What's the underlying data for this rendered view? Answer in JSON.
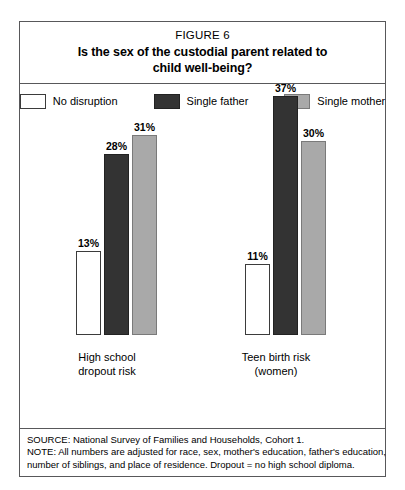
{
  "figure": {
    "number_label": "FIGURE 6",
    "title": "Is the sex of the custodial parent related to child well-being?",
    "title_line_1": "Is the sex of the custodial parent related to",
    "title_line_2": "child well-being?"
  },
  "legend": {
    "items": [
      {
        "label": "No disruption",
        "color": "#ffffff",
        "border": "#3b3b3b"
      },
      {
        "label": "Single father",
        "color": "#333333",
        "border": "#222222"
      },
      {
        "label": "Single mother",
        "color": "#a9a9a9",
        "border": "#7a7a7a"
      }
    ]
  },
  "footer": {
    "line_1": "SOURCE: National Survey of Families and Households, Cohort 1.",
    "line_2": "NOTE: All numbers are adjusted for race, sex, mother's education, father's education,",
    "line_3": "number of siblings, and place of residence. Dropout = no high school diploma."
  },
  "chart_data": {
    "type": "bar",
    "title": "Is the sex of the custodial parent related to child well-being?",
    "xlabel": "",
    "ylabel": "",
    "ylim": [
      0,
      40
    ],
    "grid": false,
    "legend_position": "top",
    "value_labels": true,
    "unit": "%",
    "categories": [
      "High school dropout risk",
      "Teen birth risk (women)"
    ],
    "category_lines": [
      [
        "High school",
        "dropout risk"
      ],
      [
        "Teen birth risk",
        "(women)"
      ]
    ],
    "series": [
      {
        "name": "No disruption",
        "color": "#ffffff",
        "values": [
          13,
          11
        ],
        "labels": [
          "13%",
          "11%"
        ]
      },
      {
        "name": "Single father",
        "color": "#333333",
        "values": [
          28,
          37
        ],
        "labels": [
          "28%",
          "37%"
        ]
      },
      {
        "name": "Single mother",
        "color": "#a9a9a9",
        "values": [
          31,
          30
        ],
        "labels": [
          "31%",
          "30%"
        ]
      }
    ]
  }
}
